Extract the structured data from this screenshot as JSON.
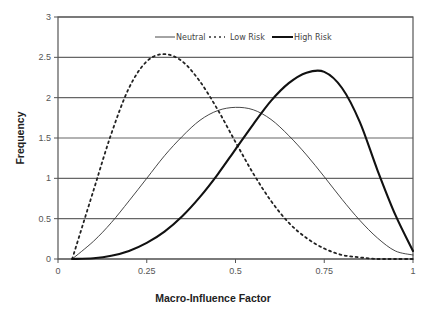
{
  "chart_data": {
    "type": "line",
    "title": "",
    "xlabel": "Macro-Influence Factor",
    "ylabel": "Frequency",
    "xlim": [
      0,
      1
    ],
    "ylim": [
      0,
      3
    ],
    "x_ticks": [
      "0",
      "0.25",
      "0.5",
      "0.75",
      "1"
    ],
    "y_ticks": [
      "0",
      "0.5",
      "1",
      "1.5",
      "2",
      "2.5",
      "3"
    ],
    "grid": "horizontal",
    "legend_position": "top-right inside",
    "x": [
      0.04,
      0.1,
      0.15,
      0.2,
      0.25,
      0.3,
      0.35,
      0.4,
      0.45,
      0.5,
      0.55,
      0.6,
      0.65,
      0.7,
      0.75,
      0.8,
      0.85,
      0.9,
      0.95,
      1.0
    ],
    "series": [
      {
        "name": "Neutral",
        "style": "thin solid",
        "values": [
          0.0,
          0.22,
          0.45,
          0.72,
          1.0,
          1.28,
          1.52,
          1.72,
          1.84,
          1.88,
          1.85,
          1.73,
          1.53,
          1.29,
          1.02,
          0.74,
          0.48,
          0.26,
          0.1,
          0.05
        ]
      },
      {
        "name": "Low Risk",
        "style": "dotted",
        "values": [
          0.0,
          0.85,
          1.55,
          2.12,
          2.45,
          2.54,
          2.45,
          2.2,
          1.85,
          1.45,
          1.06,
          0.72,
          0.45,
          0.26,
          0.13,
          0.05,
          0.02,
          0.0,
          0.0,
          0.0
        ]
      },
      {
        "name": "High Risk",
        "style": "thick solid",
        "values": [
          0.0,
          0.01,
          0.04,
          0.1,
          0.2,
          0.34,
          0.53,
          0.77,
          1.05,
          1.36,
          1.67,
          1.96,
          2.18,
          2.31,
          2.32,
          2.12,
          1.7,
          1.1,
          0.55,
          0.1
        ]
      }
    ]
  },
  "legend": [
    {
      "label": "Neutral"
    },
    {
      "label": "Low Risk"
    },
    {
      "label": "High Risk"
    }
  ]
}
